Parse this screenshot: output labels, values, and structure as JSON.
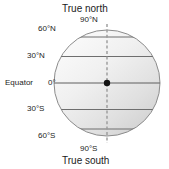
{
  "figure": {
    "kind": "earth-latitude-diagram",
    "labels": {
      "true_north": "True north",
      "true_south": "True south",
      "pole_north": "90°N",
      "pole_south": "90°S",
      "equator_name": "Equator",
      "equator_value": "0°",
      "lat_60n": "60°N",
      "lat_30n": "30°N",
      "lat_30s": "30°S",
      "lat_60s": "60°S"
    },
    "geometry": {
      "center_x": 107,
      "center_y": 83,
      "radius": 53,
      "latitudes_deg": [
        90,
        60,
        30,
        0,
        -30,
        -60,
        -90
      ]
    },
    "colors": {
      "globe_light": "#f2f2f2",
      "globe_dark": "#d2d2d2",
      "outline": "#8c8c8c",
      "latitude_line": "#6e6e6e",
      "axis_line": "#9a9a9a",
      "center_dot": "#141414",
      "text": "#1c1c1c",
      "background": "#ffffff"
    },
    "elements": {
      "axis_style": "dashed-vertical-rotation-axis",
      "center_marker": "filled-circle",
      "sphere_shading": "diagonal-gradient-light-top-left"
    }
  }
}
